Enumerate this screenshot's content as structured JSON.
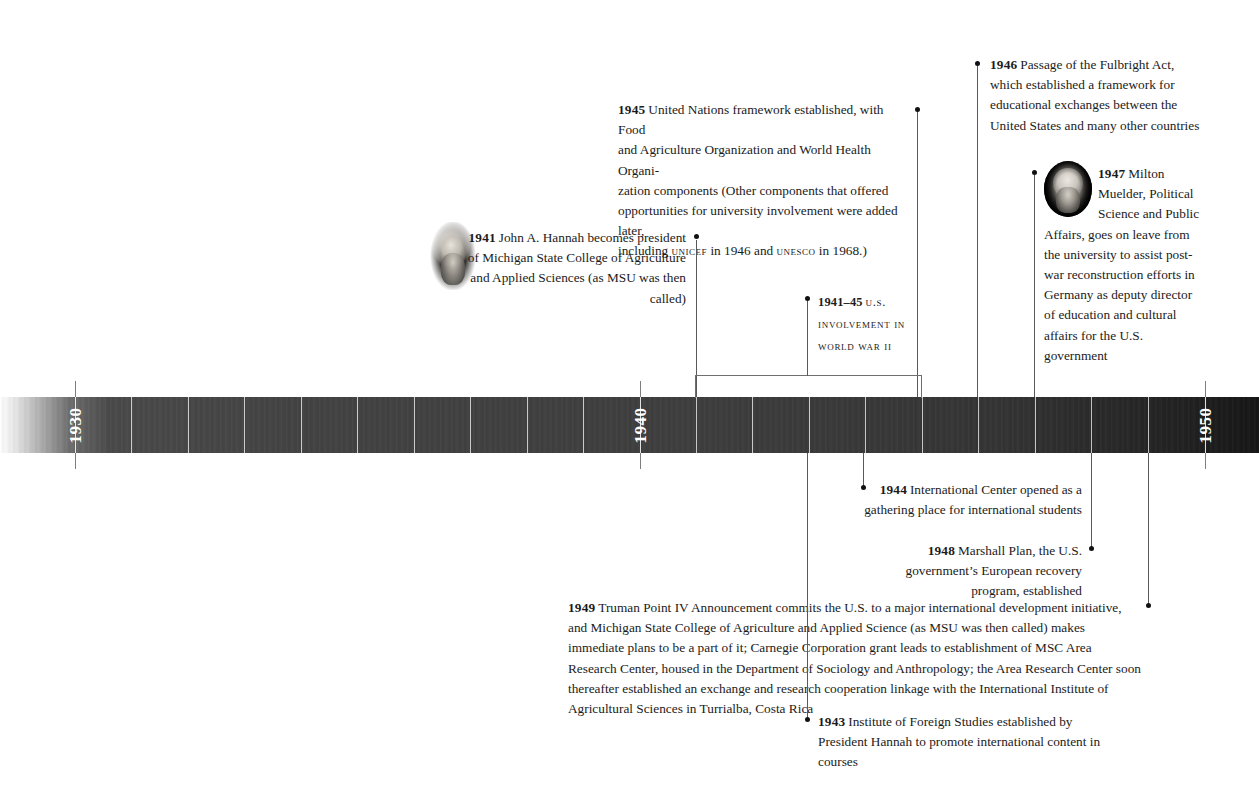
{
  "document": {
    "type": "historical-timeline",
    "subject": "MSU international involvement, 1930s–1950"
  },
  "timeline": {
    "axis_years": [
      "1930",
      "1940",
      "1950"
    ],
    "start_year": 1928,
    "end_year": 1951,
    "tick_interval_years": 1
  },
  "entries": [
    {
      "id": "1945-un",
      "year": "1945",
      "text": "United Nations framework established, with Food and Agriculture Organization and World Health Organization components (Other components that offered opportunities for university involvement were added later, including UNICEF in 1946 and UNESCO in 1968.)",
      "line1": "United Nations framework established, with Food",
      "line2": "and Agriculture Organization and World Health Organi-",
      "line3": "zation components (Other components that offered",
      "line4": "opportunities for university involvement were added later,",
      "line5_a": "including ",
      "line5_sc1": "unicef",
      "line5_b": " in 1946 and ",
      "line5_sc2": "unesco",
      "line5_c": " in 1968.)"
    },
    {
      "id": "1946-fulbright",
      "year": "1946",
      "text": "Passage of the Fulbright Act, which established a framework for educational exchanges between the United States and many other countries"
    },
    {
      "id": "1947-muelder",
      "year": "1947",
      "text": "Milton Muelder, Political Science and Public Affairs, goes on leave from the university to assist post-war reconstruction efforts in Germany as deputy director of education and cultural affairs for the U.S. government",
      "has_portrait": true,
      "portrait_name": "portrait-milton-muelder"
    },
    {
      "id": "1941-hannah",
      "year": "1941",
      "text": "John A. Hannah becomes president of Michigan State College of Agriculture and Applied Sciences (as MSU was then called)",
      "has_portrait": true,
      "portrait_name": "portrait-john-a-hannah"
    },
    {
      "id": "1941-45-wwii",
      "year": "1941–45",
      "text": "U.S. involvement in World War II",
      "style": "small-caps"
    },
    {
      "id": "1944-international-center",
      "year": "1944",
      "text": "International Center opened as a gathering place for international students"
    },
    {
      "id": "1948-marshall-plan",
      "year": "1948",
      "text": "Marshall Plan, the U.S. government’s European recovery program, established"
    },
    {
      "id": "1949-point-iv",
      "year": "1949",
      "text": "Truman Point IV Announcement commits the U.S. to a major international development initiative, and Michigan State College of Agriculture and Applied Science (as MSU was then called) makes immediate plans to be a part of it; Carnegie Corporation grant leads to establishment of MSC Area Research Center, housed in the Department of Sociology and Anthropology; the Area Research Center soon thereafter established an exchange and research cooperation linkage with the International Institute of Agricultural Sciences in Turrialba, Costa Rica"
    },
    {
      "id": "1943-foreign-studies",
      "year": "1943",
      "text": "Institute of Foreign Studies established by President Hannah to promote international content in courses"
    }
  ],
  "colors": {
    "bar_dark": "#3e3e3e",
    "bar_darkest": "#161616",
    "year_label": "#ffffff",
    "text": "#1b1b1b",
    "connector": "#5a5a5a",
    "dot": "#111111"
  }
}
